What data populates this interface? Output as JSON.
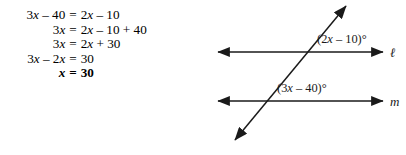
{
  "background_color": "#ffffff",
  "ink_color": "#1a1a1a",
  "solution": {
    "title": "algebraic-solution",
    "steps": [
      {
        "lhs": "3x – 40",
        "eq": "=",
        "rhs": "2x – 10",
        "bold": false
      },
      {
        "lhs": "3x",
        "eq": "=",
        "rhs": "2x – 10 + 40",
        "bold": false
      },
      {
        "lhs": "3x",
        "eq": "=",
        "rhs": "2x + 30",
        "bold": false
      },
      {
        "lhs": "3x – 2x",
        "eq": "=",
        "rhs": "30",
        "bold": false
      },
      {
        "lhs": "x",
        "eq": "=",
        "rhs": "30",
        "bold": true
      }
    ]
  },
  "figure": {
    "type": "parallel-lines-with-transversal",
    "lines": [
      {
        "name": "ℓ",
        "label_x": 184,
        "label_y": 57,
        "y": 52,
        "x_start": 12,
        "x_end": 177
      },
      {
        "name": "m",
        "label_x": 184,
        "label_y": 106,
        "y": 101,
        "x_start": 12,
        "x_end": 177
      }
    ],
    "transversal": {
      "x1": 29,
      "y1": 140,
      "x2": 140,
      "y2": 6
    },
    "angles": [
      {
        "text": "(2x – 10)°",
        "x": 111,
        "y": 43
      },
      {
        "text": "(3x – 40)°",
        "x": 71,
        "y": 92
      }
    ]
  }
}
